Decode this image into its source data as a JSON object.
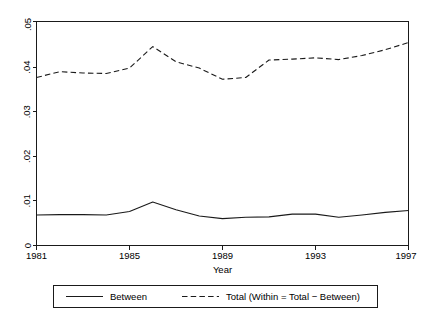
{
  "chart_data": {
    "type": "line",
    "title": "",
    "subtitle": "",
    "xlabel": "Year",
    "ylabel": "",
    "x": [
      1981,
      1982,
      1983,
      1984,
      1985,
      1986,
      1987,
      1988,
      1989,
      1990,
      1991,
      1992,
      1993,
      1994,
      1995,
      1996,
      1997
    ],
    "xlim": [
      1981,
      1997
    ],
    "ylim": [
      0,
      0.05
    ],
    "xticks": [
      1981,
      1985,
      1989,
      1993,
      1997
    ],
    "xticklabels": [
      "1981",
      "1985",
      "1989",
      "1993",
      "1997"
    ],
    "yticks": [
      0,
      0.01,
      0.02,
      0.03,
      0.04,
      0.05
    ],
    "yticklabels": [
      "0",
      ".01",
      ".02",
      ".03",
      ".04",
      ".05"
    ],
    "grid": false,
    "legend_position": "bottom",
    "series": [
      {
        "name": "Between",
        "style": "solid",
        "color": "#1a1a1a",
        "values": [
          0.0068,
          0.0069,
          0.0069,
          0.0068,
          0.0076,
          0.0097,
          0.008,
          0.0066,
          0.006,
          0.0063,
          0.0064,
          0.007,
          0.007,
          0.0063,
          0.0068,
          0.0074,
          0.0078
        ]
      },
      {
        "name": "Total (Within = Total − Between)",
        "style": "dashed",
        "color": "#1a1a1a",
        "values": [
          0.0375,
          0.0388,
          0.0385,
          0.0384,
          0.0396,
          0.0444,
          0.041,
          0.0396,
          0.0371,
          0.0375,
          0.0414,
          0.0416,
          0.0419,
          0.0415,
          0.0424,
          0.0437,
          0.0453
        ]
      }
    ]
  },
  "axes": {
    "x_axis_title": "Year",
    "y_axis_title": ""
  },
  "legend": {
    "entries": [
      {
        "label": "Between",
        "style": "solid"
      },
      {
        "label": "Total (Within = Total − Between)",
        "style": "dashed"
      }
    ]
  }
}
